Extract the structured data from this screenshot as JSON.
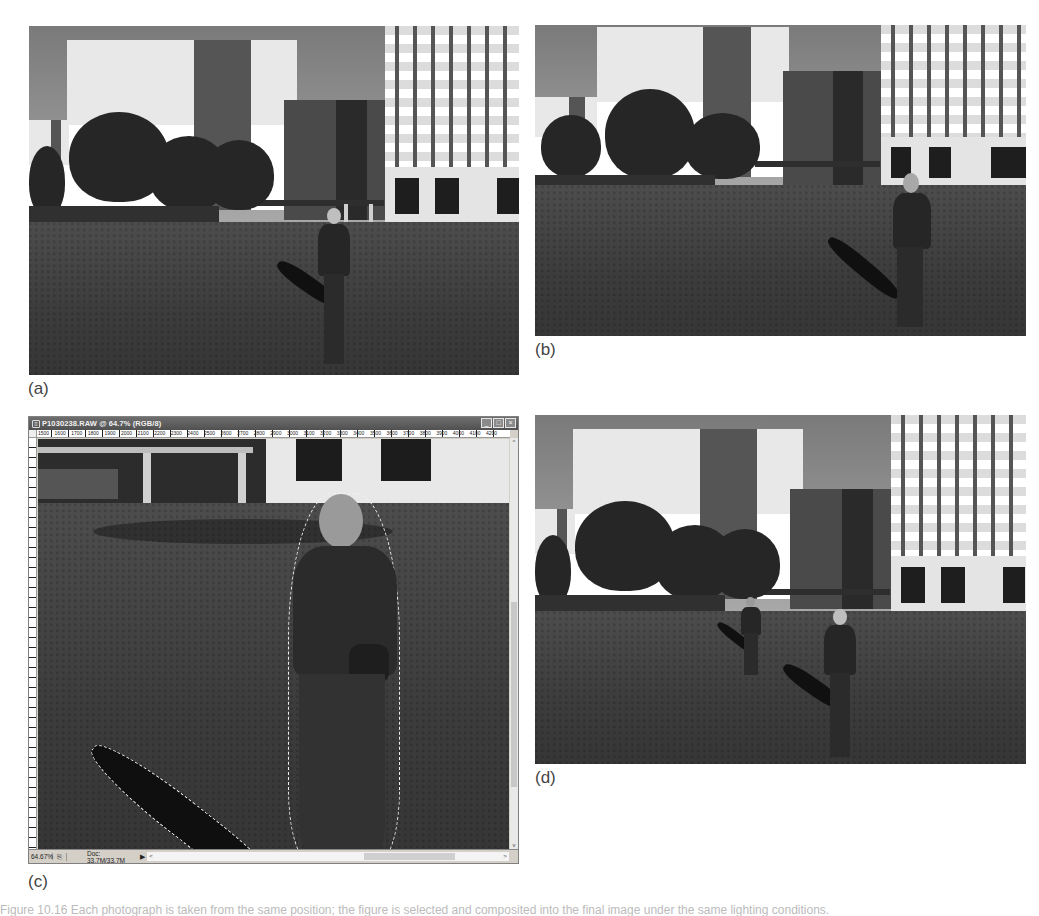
{
  "figure": {
    "caption": "Figure 10.16  Each photograph is taken from the same position; the figure is selected and composited into the final image under the same lighting conditions."
  },
  "panels": [
    {
      "id": "a",
      "label": "(a)",
      "description": "Woman walking toward camera on lawn in front of large office buildings"
    },
    {
      "id": "b",
      "label": "(b)",
      "description": "Same woman walking away from camera on the lawn, same buildings behind"
    },
    {
      "id": "c",
      "label": "(c)",
      "description": "Photoshop document window with figure and shadow selected (marching ants)"
    },
    {
      "id": "d",
      "label": "(d)",
      "description": "Composite: both figures appear on the lawn in one image"
    }
  ],
  "photoshop_window": {
    "title": "P1030238.RAW @ 64.7% (RGB/8)",
    "title_icon": "document-icon",
    "buttons": {
      "minimize": "_",
      "maximize": "□",
      "close": "×"
    },
    "ruler_ticks": [
      "1500",
      "1600",
      "1700",
      "1800",
      "1900",
      "2000",
      "2100",
      "2200",
      "2300",
      "2400",
      "2500",
      "2600",
      "2700",
      "2800",
      "2900",
      "3000",
      "3100",
      "3200",
      "3300",
      "3400",
      "3500",
      "3600",
      "3700",
      "3800",
      "3900",
      "4000",
      "4100",
      "4200"
    ],
    "status_bar": {
      "zoom": "64.67%",
      "preview_icon": "⎘",
      "doc_info": "Doc: 33.7M/33.7M",
      "arrow": "▶",
      "scroll_left": "<",
      "scroll_right": ">"
    },
    "scroll_up": "^",
    "scroll_down": "v"
  },
  "colors": {
    "page_bg": "#ffffff",
    "label_text": "#444444",
    "window_chrome": "#d4d0c8",
    "titlebar": "#5a5a5a"
  }
}
